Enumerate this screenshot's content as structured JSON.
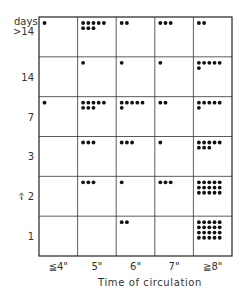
{
  "chart_data": {
    "type": "table",
    "subtype": "dot-matrix",
    "title": "",
    "ylabel": "days",
    "xlabel": "Time of circulation",
    "columns": [
      "≦4\"",
      "5\"",
      "6\"",
      "7\"",
      "≧8\""
    ],
    "rows": [
      ">14",
      "14",
      "7",
      "3",
      "2",
      "1"
    ],
    "row_markers": {
      "2": "☦"
    },
    "counts": [
      [
        1,
        8,
        2,
        3,
        2
      ],
      [
        0,
        1,
        1,
        1,
        6
      ],
      [
        1,
        8,
        6,
        2,
        6
      ],
      [
        0,
        3,
        3,
        1,
        8
      ],
      [
        0,
        3,
        1,
        3,
        15
      ],
      [
        0,
        0,
        2,
        0,
        20
      ]
    ],
    "grid": true,
    "dot_color": "#111111"
  }
}
